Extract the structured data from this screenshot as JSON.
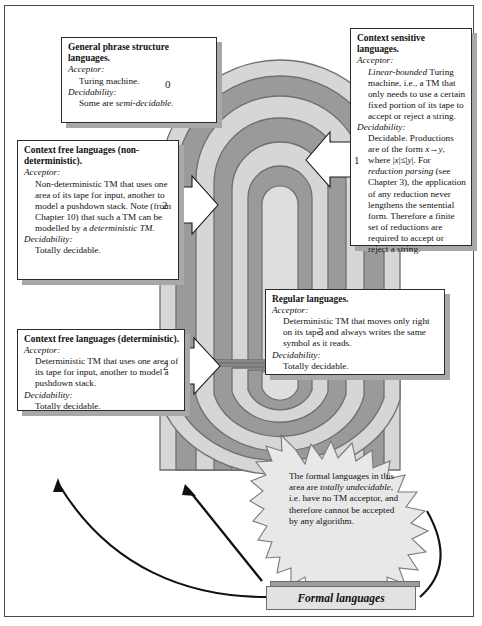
{
  "diagram": {
    "bottom_bar_label": "Formal languages",
    "colors": {
      "band_dark": "#9a9a9a",
      "band_light": "#d6d6d6",
      "band_outline": "#6f6f6f",
      "box_border": "#2b2b2b",
      "box_shadow": "#a8a8a8",
      "arrow_fill": "#ffffff",
      "arrow_outline": "#1a1a1a",
      "burst_fill": "#e8e8e8",
      "burst_outline": "#7a7a7a",
      "page_border": "#4a4a4a"
    },
    "level_numbers": [
      "0",
      "1",
      "2",
      "2",
      "3"
    ],
    "boxes": [
      {
        "id": "general-phrase-structure",
        "title": "General phrase structure languages.",
        "acceptor_label": "Acceptor:",
        "acceptor_text": "Turing machine.",
        "decidability_label": "Decidability:",
        "decidability_text": "Some are semi-decidable.",
        "decidability_italic_tail": "semi-decidable.",
        "number": "0"
      },
      {
        "id": "context-sensitive",
        "title": "Context sensitive languages.",
        "acceptor_label": "Acceptor:",
        "acceptor_text": "Linear-bounded Turing machine, i.e., a TM that only needs to use a certain fixed portion of its tape to accept or reject a string.",
        "acceptor_italic_head": "Linear-bounded",
        "decidability_label": "Decidability:",
        "decidability_text": "Decidable. Productions are of the form x→y, where |x| ≤ |y|. For reduction parsing (see Chapter 3), the application of any reduction never lengthens the sentential form. Therefore a finite set of reductions are required to accept or reject a string.",
        "number": "1"
      },
      {
        "id": "context-free-nondeterministic",
        "title": "Context free languages (non-deterministic).",
        "acceptor_label": "Acceptor:",
        "acceptor_text": "Non-deterministic TM that uses one area of its tape for input, another to model a pushdown stack. Note (from Chapter 10) that such a TM can be modelled by a deterministic TM.",
        "acceptor_italic_tail": "deterministic TM.",
        "decidability_label": "Decidability:",
        "decidability_text": "Totally decidable.",
        "number": "2"
      },
      {
        "id": "context-free-deterministic",
        "title": "Context free languages (deterministic).",
        "acceptor_label": "Acceptor:",
        "acceptor_text": "Deterministic TM that uses one area of its tape for input, another to model a pushdown stack.",
        "decidability_label": "Decidability:",
        "decidability_text": "Totally decidable.",
        "number": "2"
      },
      {
        "id": "regular",
        "title": "Regular languages.",
        "acceptor_label": "Acceptor:",
        "acceptor_text": "Deterministic TM that moves only right on its tape, and always writes the same symbol as it reads.",
        "decidability_label": "Decidability:",
        "decidability_text": "Totally decidable.",
        "number": "3"
      }
    ],
    "burst": {
      "text_run_1": "The formal languages in this area are ",
      "text_italic": "totally undecidable",
      "text_run_2": ", i.e. have no TM acceptor, and therefore cannot be accepted by any algorithm."
    }
  }
}
